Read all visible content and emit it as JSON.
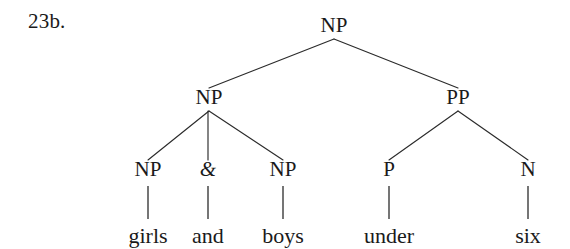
{
  "example": {
    "number_label": "23b."
  },
  "tree": {
    "sentence": "girls and boys under six",
    "nodes": {
      "root_np": {
        "label": "NP",
        "x": 334,
        "y": 32
      },
      "left_np": {
        "label": "NP",
        "x": 209,
        "y": 104
      },
      "pp": {
        "label": "PP",
        "x": 458,
        "y": 104
      },
      "np_a": {
        "label": "NP",
        "x": 148,
        "y": 176
      },
      "conj": {
        "label": "&",
        "x": 208,
        "y": 176
      },
      "np_b": {
        "label": "NP",
        "x": 283,
        "y": 176
      },
      "p": {
        "label": "P",
        "x": 389,
        "y": 176
      },
      "n": {
        "label": "N",
        "x": 528,
        "y": 176
      }
    },
    "leaves": {
      "girls": {
        "label": "girls",
        "x": 148,
        "y": 243
      },
      "and": {
        "label": "and",
        "x": 208,
        "y": 243
      },
      "boys": {
        "label": "boys",
        "x": 283,
        "y": 243
      },
      "under": {
        "label": "under",
        "x": 389,
        "y": 243
      },
      "six": {
        "label": "six",
        "x": 528,
        "y": 243
      }
    },
    "edges": {
      "root_to_left_np": "M334,39 L209,88",
      "root_to_pp": "M334,39 L458,88",
      "left_np_to_np_a": "M209,111 L148,160",
      "left_np_to_conj": "M208,111 L208,160",
      "left_np_to_np_b": "M209,111 L283,160",
      "pp_to_p": "M458,111 L389,160",
      "pp_to_n": "M458,111 L528,160",
      "np_a_to_girls": "M148,186 L148,219",
      "conj_to_and": "M208,186 L208,219",
      "np_b_to_boys": "M283,186 L283,219",
      "p_to_under": "M389,186 L389,219",
      "n_to_six": "M528,186 L528,219"
    }
  },
  "colors": {
    "ink": "#1a1a1a",
    "line": "#2b2b2b",
    "background": "#ffffff"
  }
}
